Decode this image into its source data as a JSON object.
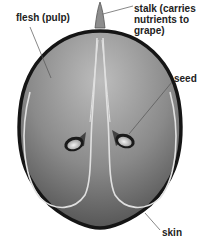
{
  "diagram": {
    "labels": {
      "flesh": "flesh (pulp)",
      "stalk": "stalk (carries\nnutrients to\ngrape)",
      "seed": "seed",
      "skin": "skin"
    },
    "colors": {
      "skin": "#1a1a1a",
      "flesh_light": "#b5b5b5",
      "flesh_dark": "#555555",
      "vein": "#e6e6e6",
      "leader_line": "#555555"
    }
  }
}
